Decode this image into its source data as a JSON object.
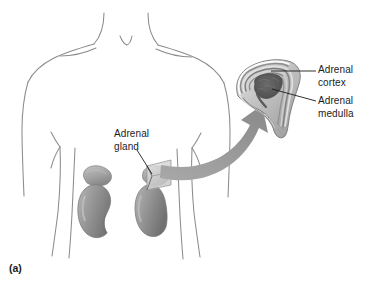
{
  "figure": {
    "caption": "(a)",
    "type": "anatomical-illustration",
    "colors": {
      "background": "#ffffff",
      "body_outline": "#8c8c90",
      "kidney_fill": "#9a9a9a",
      "kidney_shadow": "#7b7b7b",
      "kidney_highlight": "#b9b9b9",
      "gland_cap": "#a9a9a9",
      "arrow": "#9a9a9a",
      "cortex_band_light": "#d8d8d8",
      "cortex_band_mid": "#a6a6a6",
      "cortex_band_dark": "#6f6f6f",
      "medulla": "#545454",
      "leader_line": "#1b1b1b",
      "text": "#1b1b1b",
      "cut_plane": "#d5d5d5"
    }
  },
  "labels": {
    "cortex": {
      "line1": "Adrenal",
      "line2": "cortex",
      "target": "adrenal-cortex-outer-layers"
    },
    "medulla": {
      "line1": "Adrenal",
      "line2": "medulla",
      "target": "adrenal-medulla-core"
    },
    "gland": {
      "line1": "Adrenal",
      "line2": "gland",
      "target": "adrenal-gland-on-kidney"
    }
  },
  "structures": [
    {
      "name": "human-torso-outline",
      "description": "anterior view of head-neck-shoulders and trunk, line art"
    },
    {
      "name": "left-kidney",
      "description": "bean-shaped kidney, viewer left"
    },
    {
      "name": "right-kidney",
      "description": "bean-shaped kidney, viewer right, with cut-plane wedge"
    },
    {
      "name": "adrenal-gland-cap",
      "description": "cap-shaped gland atop each kidney"
    },
    {
      "name": "magnification-arrow",
      "description": "thick curved arrow from kidney region to cross-section"
    },
    {
      "name": "adrenal-cross-section",
      "description": "magnified sectioned adrenal gland showing cortex layers and medulla"
    }
  ]
}
